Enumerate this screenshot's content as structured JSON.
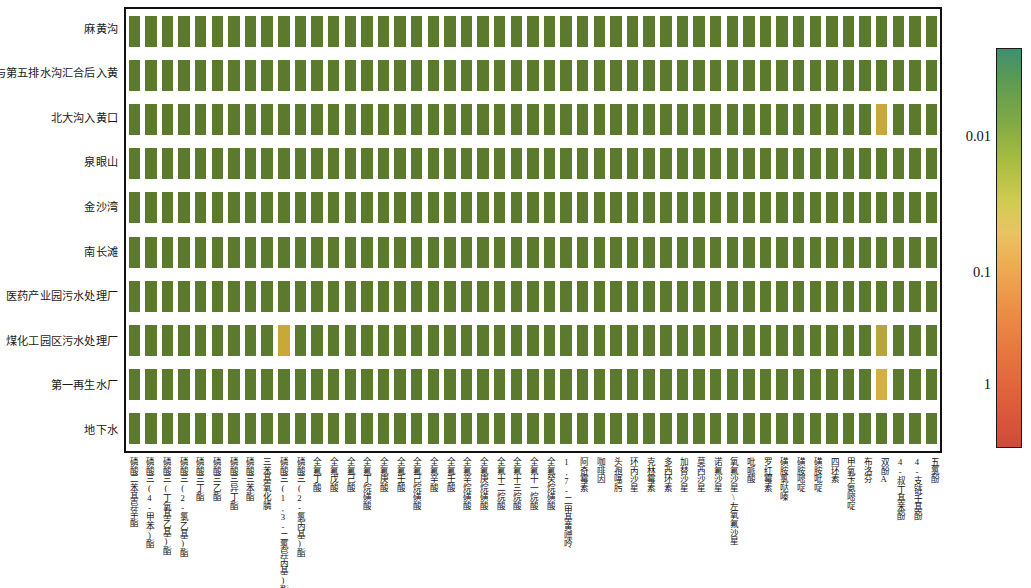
{
  "figure": {
    "type": "heatmap",
    "background": "#ffffff",
    "plot_border_color": "#111111"
  },
  "rows": [
    {
      "label": "麻黄沟"
    },
    {
      "label": "第三与第五排水沟汇合后入黄"
    },
    {
      "label": "北大沟入黄口"
    },
    {
      "label": "泉眼山"
    },
    {
      "label": "金沙湾"
    },
    {
      "label": "南长滩"
    },
    {
      "label": "医药产业园污水处理厂"
    },
    {
      "label": "煤化工园区污水处理厂"
    },
    {
      "label": "第一再生水厂"
    },
    {
      "label": "地下水"
    }
  ],
  "columns": [
    {
      "label": "磷酸二苯基异辛酯"
    },
    {
      "label": "磷酸三(4-甲苯)酯"
    },
    {
      "label": "磷酸三(丁氧基乙基)酯"
    },
    {
      "label": "磷酸三(2-氯乙基)酯"
    },
    {
      "label": "磷酸三丁酯"
    },
    {
      "label": "磷酸三乙酯"
    },
    {
      "label": "磷酸三异丁酯"
    },
    {
      "label": "磷酸三苯酯"
    },
    {
      "label": "三苯基氧化膦"
    },
    {
      "label": "磷酸三(1,3-二氯异丙基)酯"
    },
    {
      "label": "磷酸三(2-氯丙基)酯"
    },
    {
      "label": "全氟丁酸"
    },
    {
      "label": "全氟戊酸"
    },
    {
      "label": "全氟己酸"
    },
    {
      "label": "全氟丁烷磺酸"
    },
    {
      "label": "全氟庚酸"
    },
    {
      "label": "全氟壬酸"
    },
    {
      "label": "全氟己烷磺酸"
    },
    {
      "label": "全氟辛酸"
    },
    {
      "label": "全氟壬酸"
    },
    {
      "label": "全氟辛烷磺酸"
    },
    {
      "label": "全氟庚烷磺酸"
    },
    {
      "label": "全氟十二烷酸"
    },
    {
      "label": "全氟十三烷酸"
    },
    {
      "label": "全氟十一烷酸"
    },
    {
      "label": "全氟癸烷磺酸"
    },
    {
      "label": "1,7-二甲基黄嘌呤"
    },
    {
      "label": "阿奇霉素"
    },
    {
      "label": "咖啡因"
    },
    {
      "label": "头孢噻肟"
    },
    {
      "label": "环丙沙星"
    },
    {
      "label": "克林霉素"
    },
    {
      "label": "多西环素"
    },
    {
      "label": "加替沙星"
    },
    {
      "label": "莫西沙星"
    },
    {
      "label": "诺氟沙星"
    },
    {
      "label": "氧氟沙星\\左氧氟沙星"
    },
    {
      "label": "吡哌酸"
    },
    {
      "label": "罗红霉素"
    },
    {
      "label": "磺胺氯哒嗪"
    },
    {
      "label": "磺胺嘧啶"
    },
    {
      "label": "磺胺吡啶"
    },
    {
      "label": "四环素"
    },
    {
      "label": "甲氧苄氨嘧啶"
    },
    {
      "label": "布洛芬"
    },
    {
      "label": "双酚A"
    },
    {
      "label": "4-叔丁基苯酚"
    },
    {
      "label": "4-支链壬基酚"
    },
    {
      "label": "五氯酚"
    }
  ],
  "colorbar": {
    "scale": "log",
    "orientation": "vertical",
    "direction": "increasing-downward",
    "ticks": [
      {
        "label": "0.01",
        "position_pct": 22
      },
      {
        "label": "0.1",
        "position_pct": 56
      },
      {
        "label": "1",
        "position_pct": 84
      }
    ],
    "gradient_stops": [
      "#3f8f6f",
      "#5d9a52",
      "#7fa945",
      "#a8bc3f",
      "#cfcb52",
      "#e8c462",
      "#eeab50",
      "#ec8d45",
      "#e5733d",
      "#de5f3a",
      "#cf4a3a"
    ]
  },
  "chart_data": {
    "type": "heatmap",
    "title": "",
    "xlabel": "",
    "ylabel": "",
    "colorbar_ticks": [
      "0.01",
      "0.1",
      "1"
    ],
    "colorbar_scale": "log",
    "default_cell_color": "#5b7a2e",
    "default_cell_value": 0.004,
    "categories_x": [
      "磷酸二苯基异辛酯",
      "磷酸三(4-甲苯)酯",
      "磷酸三(丁氧基乙基)酯",
      "磷酸三(2-氯乙基)酯",
      "磷酸三丁酯",
      "磷酸三乙酯",
      "磷酸三异丁酯",
      "磷酸三苯酯",
      "三苯基氧化膦",
      "磷酸三(1,3-二氯异丙基)酯",
      "磷酸三(2-氯丙基)酯",
      "全氟丁酸",
      "全氟戊酸",
      "全氟己酸",
      "全氟丁烷磺酸",
      "全氟庚酸",
      "全氟壬酸",
      "全氟己烷磺酸",
      "全氟辛酸",
      "全氟壬酸",
      "全氟辛烷磺酸",
      "全氟庚烷磺酸",
      "全氟十二烷酸",
      "全氟十三烷酸",
      "全氟十一烷酸",
      "全氟癸烷磺酸",
      "1,7-二甲基黄嘌呤",
      "阿奇霉素",
      "咖啡因",
      "头孢噻肟",
      "环丙沙星",
      "克林霉素",
      "多西环素",
      "加替沙星",
      "莫西沙星",
      "诺氟沙星",
      "氧氟沙星\\左氧氟沙星",
      "吡哌酸",
      "罗红霉素",
      "磺胺氯哒嗪",
      "磺胺嘧啶",
      "磺胺吡啶",
      "四环素",
      "甲氧苄氨嘧啶",
      "布洛芬",
      "双酚A",
      "4-叔丁基苯酚",
      "4-支链壬基酚",
      "五氯酚"
    ],
    "categories_y": [
      "麻黄沟",
      "第三与第五排水沟汇合后入黄",
      "北大沟入黄口",
      "泉眼山",
      "金沙湾",
      "南长滩",
      "医药产业园污水处理厂",
      "煤化工园区污水处理厂",
      "第一再生水厂",
      "地下水"
    ],
    "highlighted_cells": [
      {
        "row": 2,
        "col": 45,
        "color": "#c9a83a",
        "approx_value": 0.02
      },
      {
        "row": 7,
        "col": 9,
        "color": "#c9a83a",
        "approx_value": 0.02
      },
      {
        "row": 7,
        "col": 45,
        "color": "#b8a63c",
        "approx_value": 0.018
      },
      {
        "row": 8,
        "col": 45,
        "color": "#d4b041",
        "approx_value": 0.025
      }
    ]
  }
}
